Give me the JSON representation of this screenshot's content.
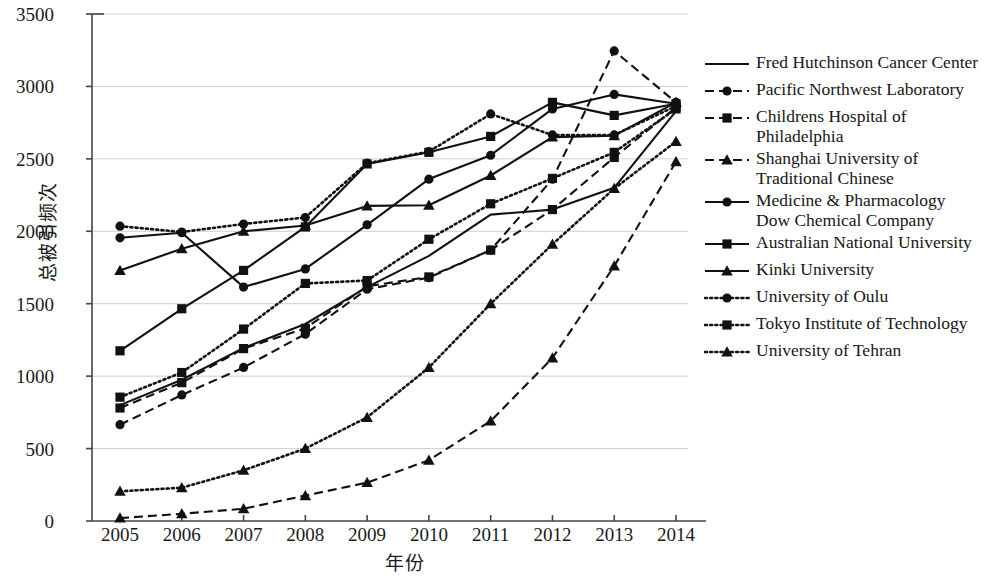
{
  "chart_data": {
    "type": "line",
    "title": "",
    "xlabel": "年份",
    "ylabel": "总被引频次",
    "x": [
      2005,
      2006,
      2007,
      2008,
      2009,
      2010,
      2011,
      2012,
      2013,
      2014
    ],
    "xtick_labels": [
      "2005",
      "2006",
      "2007",
      "2008",
      "2009",
      "2010",
      "2011",
      "2012",
      "2013",
      "2014"
    ],
    "ytick_labels": [
      "0",
      "500",
      "1000",
      "1500",
      "2000",
      "2500",
      "3000",
      "3500"
    ],
    "yticks": [
      0,
      500,
      1000,
      1500,
      2000,
      2500,
      3000,
      3500
    ],
    "ylim": [
      0,
      3500
    ],
    "grid": "horizontal",
    "legend_position": "right",
    "series": [
      {
        "name": "Fred Hutchinson Cancer Center",
        "style": "solid",
        "marker": "none",
        "values": [
          800,
          975,
          1195,
          1360,
          1615,
          1830,
          2115,
          2150,
          2300,
          2830
        ]
      },
      {
        "name": "Pacific Northwest Laboratory",
        "style": "dashed",
        "marker": "circle",
        "values": [
          665,
          870,
          1060,
          1290,
          1600,
          1680,
          1870,
          2360,
          3245,
          2890
        ]
      },
      {
        "name": "Childrens Hospital of Philadelphia",
        "style": "dashed",
        "marker": "square",
        "values": [
          780,
          955,
          1190,
          1330,
          1620,
          1685,
          1870,
          2150,
          2510,
          2855
        ]
      },
      {
        "name": "Shanghai University of Traditional Chinese",
        "style": "dashed",
        "marker": "triangle",
        "values": [
          20,
          50,
          85,
          175,
          265,
          420,
          690,
          1125,
          1760,
          2480
        ]
      },
      {
        "name": "Medicine & Pharmacology Dow Chemical Company",
        "style": "solid",
        "marker": "circle",
        "values": [
          1955,
          1990,
          1615,
          1740,
          2045,
          2360,
          2525,
          2845,
          2945,
          2880
        ]
      },
      {
        "name": "Australian National University",
        "style": "solid",
        "marker": "square",
        "values": [
          1175,
          1465,
          1730,
          2030,
          2465,
          2545,
          2655,
          2890,
          2800,
          2880
        ]
      },
      {
        "name": "Kinki University",
        "style": "solid",
        "marker": "triangle",
        "values": [
          1730,
          1880,
          2000,
          2040,
          2175,
          2180,
          2385,
          2650,
          2660,
          2890
        ]
      },
      {
        "name": "University of Oulu",
        "style": "dotted",
        "marker": "circle",
        "values": [
          2035,
          1995,
          2050,
          2095,
          2470,
          2550,
          2810,
          2665,
          2665,
          2865
        ]
      },
      {
        "name": "Tokyo Institute of Technology",
        "style": "dotted",
        "marker": "square",
        "values": [
          855,
          1025,
          1325,
          1640,
          1660,
          1945,
          2190,
          2365,
          2545,
          2845
        ]
      },
      {
        "name": "University of Tehran",
        "style": "dotted",
        "marker": "triangle",
        "values": [
          205,
          230,
          350,
          500,
          715,
          1060,
          1500,
          1910,
          2295,
          2620
        ]
      }
    ]
  },
  "colors": {
    "line": "#111111",
    "grid": "#cfcfcf",
    "axis": "#444444",
    "text": "#1a1a1a"
  }
}
